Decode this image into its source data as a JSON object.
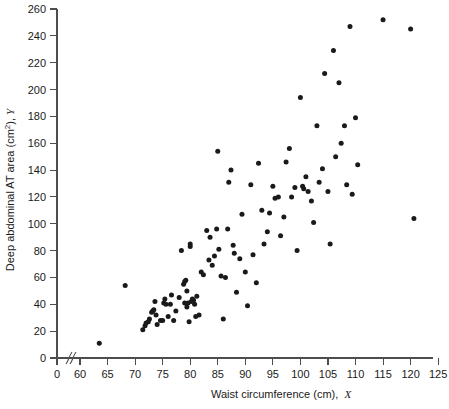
{
  "figure": {
    "background_color": "#ffffff",
    "point_color": "#1a1a1a",
    "axis_color": "#4d4d4d"
  },
  "chart_data": {
    "type": "scatter",
    "title": "",
    "xlabel": "Waist circumference (cm), X",
    "xlabel_main": "Waist circumference (cm),",
    "xlabel_symbol": "X",
    "ylabel": "Deep abdominal AT area (cm2), Y",
    "ylabel_main": "Deep abdominal AT area (cm",
    "ylabel_sup": "2",
    "ylabel_tail": "),",
    "ylabel_symbol": "Y",
    "grid": false,
    "legend": false,
    "axis_break_x": true,
    "xlim": [
      0,
      125
    ],
    "ylim": [
      0,
      260
    ],
    "xticks": [
      0,
      60,
      65,
      70,
      75,
      80,
      85,
      90,
      95,
      100,
      105,
      110,
      115,
      120,
      125
    ],
    "xtick_labels": [
      "0",
      "60",
      "65",
      "70",
      "75",
      "80",
      "85",
      "90",
      "95",
      "100",
      "105",
      "110",
      "115",
      "120",
      "125"
    ],
    "yticks": [
      0,
      20,
      40,
      60,
      80,
      100,
      120,
      140,
      160,
      180,
      200,
      220,
      240,
      260
    ],
    "ytick_labels": [
      "0",
      "20",
      "40",
      "60",
      "80",
      "100",
      "120",
      "140",
      "160",
      "180",
      "200",
      "220",
      "240",
      "260"
    ],
    "n_points": 109,
    "x": [
      63.5,
      68.2,
      71.4,
      71.8,
      72.0,
      72.4,
      72.6,
      73.0,
      73.2,
      73.4,
      73.6,
      73.8,
      74.0,
      74.6,
      75.0,
      75.2,
      75.4,
      75.6,
      76.0,
      76.4,
      76.6,
      77.0,
      77.4,
      78.0,
      78.4,
      78.8,
      79.0,
      79.0,
      79.2,
      79.4,
      79.4,
      79.6,
      79.8,
      80.0,
      80.0,
      80.2,
      80.4,
      80.6,
      80.8,
      81.0,
      81.2,
      81.6,
      82.0,
      82.4,
      83.0,
      83.4,
      83.6,
      84.0,
      84.4,
      84.8,
      85.0,
      85.2,
      85.6,
      86.0,
      86.4,
      86.8,
      87.0,
      87.4,
      87.8,
      88.0,
      88.4,
      89.0,
      89.4,
      90.0,
      90.4,
      91.0,
      91.4,
      92.0,
      92.4,
      93.0,
      93.4,
      94.0,
      94.4,
      95.0,
      95.4,
      96.0,
      96.4,
      97.0,
      97.4,
      98.0,
      98.4,
      99.0,
      99.4,
      100.0,
      100.4,
      100.6,
      101.0,
      101.4,
      102.0,
      102.4,
      103.0,
      103.4,
      104.0,
      104.4,
      105.0,
      105.4,
      106.0,
      106.4,
      107.0,
      107.4,
      108.0,
      108.4,
      109.0,
      109.4,
      110.0,
      110.4,
      115.0,
      120.0,
      120.6
    ],
    "y": [
      11.0,
      54.0,
      21.0,
      24.0,
      26.0,
      27.0,
      29.0,
      34.0,
      35.0,
      36.0,
      42.0,
      32.0,
      25.0,
      28.0,
      28.0,
      41.0,
      44.0,
      40.0,
      31.0,
      40.0,
      47.0,
      28.0,
      35.0,
      45.0,
      80.0,
      55.0,
      57.0,
      41.0,
      58.0,
      50.0,
      38.0,
      41.0,
      27.0,
      83.0,
      85.0,
      42.0,
      44.0,
      43.0,
      40.0,
      31.0,
      46.0,
      32.0,
      64.0,
      62.0,
      95.0,
      73.0,
      90.0,
      69.0,
      76.0,
      96.0,
      154.0,
      81.0,
      61.0,
      29.0,
      60.0,
      96.0,
      131.0,
      140.0,
      84.0,
      78.0,
      49.0,
      74.0,
      107.0,
      64.0,
      39.0,
      129.0,
      77.0,
      56.0,
      145.0,
      110.0,
      85.0,
      94.0,
      108.0,
      128.0,
      119.0,
      120.0,
      91.0,
      105.0,
      146.0,
      156.0,
      120.0,
      127.0,
      80.0,
      194.0,
      128.0,
      126.0,
      135.0,
      124.0,
      117.0,
      101.0,
      173.0,
      131.0,
      141.0,
      212.0,
      124.0,
      85.0,
      229.0,
      150.0,
      205.0,
      160.0,
      173.0,
      129.0,
      247.0,
      122.0,
      179.0,
      144.0,
      252.0,
      245.0,
      104.0
    ]
  },
  "axis": {
    "x_origin_px": 57,
    "y_origin_px": 358,
    "x_break_label": "axis-break"
  }
}
